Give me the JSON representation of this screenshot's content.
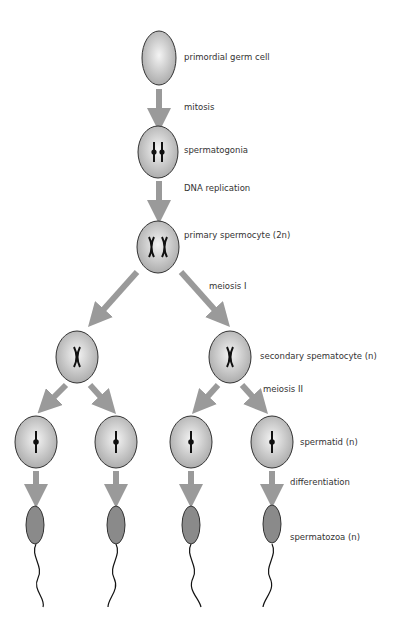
{
  "colors": {
    "cell_fill_center": "#f2f2f2",
    "cell_fill_edge": "#a8a8a8",
    "cell_stroke": "#333333",
    "arrow": "#9a9a9a",
    "sperm_head": "#8a8a8a",
    "chromosome": "#111111"
  },
  "labels": {
    "primordial": "primordial germ cell",
    "mitosis": "mitosis",
    "spermatogonia": "spermatogonia",
    "dna_replication": "DNA replication",
    "primary": "primary spermocyte (2n)",
    "meiosis1": "meiosis I",
    "secondary": "secondary spematocyte (n)",
    "meiosis2": "meiosis II",
    "spermatid": "spermatid (n)",
    "differentiation": "differentiation",
    "spermatozoa": "spermatozoa (n)"
  },
  "stages": [
    {
      "name": "primordial germ cell",
      "count": 1
    },
    {
      "name": "spermatogonia",
      "count": 1
    },
    {
      "name": "primary spermocyte (2n)",
      "count": 1
    },
    {
      "name": "secondary spematocyte (n)",
      "count": 2
    },
    {
      "name": "spermatid (n)",
      "count": 4
    },
    {
      "name": "spermatozoa (n)",
      "count": 4
    }
  ]
}
